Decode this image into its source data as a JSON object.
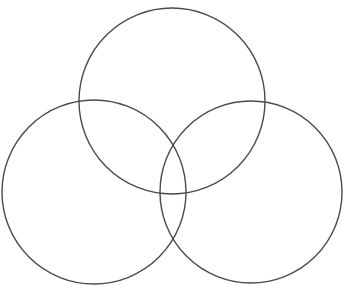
{
  "diagram": {
    "type": "venn",
    "set_count": 3,
    "stroke_color": "#4a4a4a",
    "background_color": "#ffffff",
    "labels": [],
    "circles": [
      {
        "id": "top",
        "cx": 172,
        "cy": 101,
        "r": 93
      },
      {
        "id": "left",
        "cx": 94,
        "cy": 192,
        "r": 92
      },
      {
        "id": "right",
        "cx": 251,
        "cy": 192,
        "r": 91
      }
    ]
  }
}
